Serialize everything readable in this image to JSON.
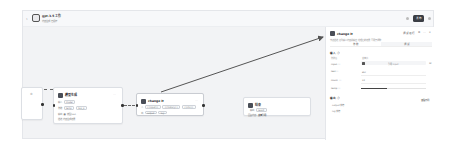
{
  "header": {
    "back_icon": "‹",
    "title": "gpt-3.5 工作",
    "subtitle": "内容生成 已保存",
    "publish_label": "发布"
  },
  "canvas": {
    "nodes": [
      {
        "id": "start",
        "title": "",
        "rows": []
      },
      {
        "id": "llm",
        "title": "模型生成",
        "rows": [
          {
            "label": "输入",
            "tags": [
              "model"
            ]
          },
          {
            "label": "参数",
            "tags": [
              "temp",
              "top_p"
            ]
          },
          {
            "label": "输出",
            "tags": [
              "■ 模型 text"
            ]
          },
          {
            "label": "",
            "tags": [
              "描述 内容生成结果"
            ]
          }
        ]
      },
      {
        "id": "change",
        "title": "change it",
        "rows": [
          {
            "label": "入",
            "tags": [
              "{{input}}",
              "{{history}}",
              "{{ctx}}"
            ]
          },
          {
            "label": "出",
            "tags": [
              "output",
              "log"
            ]
          }
        ]
      },
      {
        "id": "end",
        "title": "结束",
        "rows": [
          {
            "label": "输出",
            "tags": [
              "result"
            ]
          },
          {
            "label": "回复内容",
            "tags": [
              "变量引用"
            ]
          }
        ]
      }
    ]
  },
  "panel": {
    "title": "change it",
    "actions": [
      "调试运行",
      "⚙",
      "⋯",
      "×"
    ],
    "description": "节点描述 修改输入内容 并输出 处理后的结果 可用于调整",
    "tabs": [
      "参数",
      "调试"
    ],
    "input_section": {
      "title": "输入 ⓘ",
      "col_header_left": "参数名",
      "col_header_right": "变量值",
      "fields": [
        {
          "label": "input ⓘ",
          "value": "引用 input",
          "type": "select"
        },
        {
          "label": "text ⓘ",
          "value": "abc",
          "type": "text"
        },
        {
          "label": "count ⓘ",
          "value": "10",
          "type": "text"
        },
        {
          "label": "temp ⓘ",
          "value": "",
          "type": "slider"
        }
      ]
    },
    "output_section": {
      "title": "输出 ⓘ",
      "link_label": "查看示例",
      "items": [
        "output 字符",
        "log 字符"
      ]
    }
  }
}
